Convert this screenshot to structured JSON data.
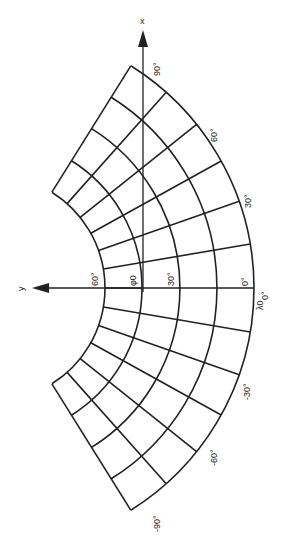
{
  "diagram": {
    "type": "conic projection graticule (rotated 90°)",
    "axes": {
      "x_label": "x",
      "y_label": "y"
    },
    "center": {
      "cx": -8,
      "cy": 288
    },
    "parallel_radii": [
      113,
      150,
      188,
      225,
      262
    ],
    "meridian_step_deg": 15,
    "meridian_range_deg": [
      -90,
      90
    ],
    "arc_half_angle_deg": 58,
    "longitude_labels": [
      {
        "text": "90°",
        "x": 157,
        "y": 66
      },
      {
        "text": "60°",
        "x": 215,
        "y": 133
      },
      {
        "text": "30°",
        "x": 249,
        "y": 200
      },
      {
        "text": "0°",
        "x": 264,
        "y": 292
      },
      {
        "text": "-30°",
        "x": 248,
        "y": 384
      },
      {
        "text": "-60°",
        "x": 215,
        "y": 450
      },
      {
        "text": "-90°",
        "x": 157,
        "y": 515
      }
    ],
    "latitude_labels": [
      {
        "text": "60°",
        "x": 95,
        "y": 278
      },
      {
        "text": "φ",
        "x": 135,
        "y": 285
      },
      {
        "text": "30°",
        "x": 170,
        "y": 278
      },
      {
        "text": "0°",
        "x": 244,
        "y": 282
      }
    ],
    "symbol_labels": {
      "phi0": "φ0",
      "lambda0": "λ0",
      "lambda0_zero": "0°"
    }
  }
}
